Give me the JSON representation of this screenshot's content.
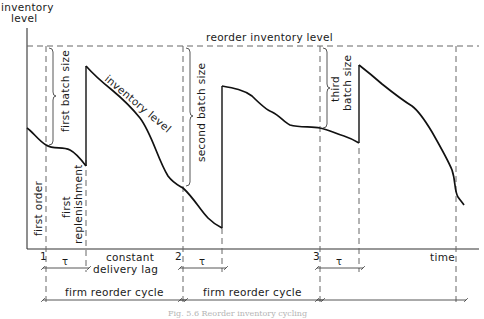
{
  "figure": {
    "y_axis_label_line1": "inventory",
    "y_axis_label_line2": "level",
    "x_axis_label": "time",
    "reorder_level_label": "reorder inventory level",
    "inventory_curve_label": "inventory level",
    "order_ticks": [
      "1",
      "2",
      "3"
    ],
    "batch_labels": {
      "first": "first batch size",
      "second": "second batch size",
      "third_line1": "third",
      "third_line2": "batch size"
    },
    "event_labels": {
      "first_order": "first order",
      "first_replenishment_line1": "first",
      "first_replenishment_line2": "replenishment"
    },
    "lag_symbol": "τ",
    "constant_lag_line1": "constant",
    "constant_lag_line2": "delivery lag",
    "cycle_label": "firm reorder cycle",
    "caption": "Fig. 5.6 Reorder inventory cycling"
  },
  "colors": {
    "line": "#111111",
    "dashed": "#666666",
    "caption": "#b5b5b5"
  }
}
